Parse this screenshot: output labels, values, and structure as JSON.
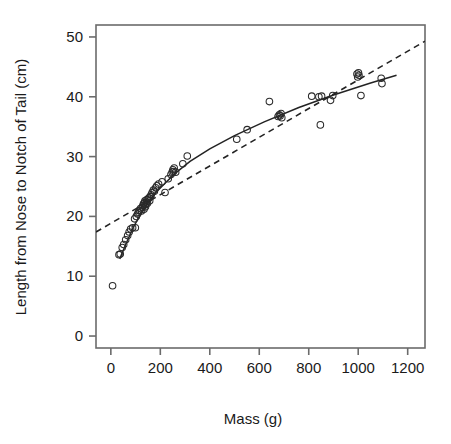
{
  "figure": {
    "width": 451,
    "height": 444,
    "background": "#ffffff",
    "foreground": "#1a1a1a",
    "axis_color": "#6b6b6b",
    "point_color": "#2a2a2a",
    "line_color": "#232323"
  },
  "chart_data": {
    "type": "scatter",
    "title": "",
    "xlabel": "Mass (g)",
    "ylabel": "Length from Nose to Notch of Tail (cm)",
    "xlim": [
      -60,
      1270
    ],
    "ylim": [
      -2,
      52
    ],
    "xticks": [
      0,
      200,
      400,
      600,
      800,
      1000,
      1200
    ],
    "xtick_labels": [
      "0",
      "200",
      "400",
      "600",
      "800",
      "1000",
      "1200"
    ],
    "yticks": [
      0,
      10,
      20,
      30,
      40,
      50
    ],
    "ytick_labels": [
      "0",
      "10",
      "20",
      "30",
      "40",
      "50"
    ],
    "grid": false,
    "legend": null,
    "marker": "open-circle",
    "marker_size": 3.3,
    "points": [
      {
        "x": 7,
        "y": 8.4
      },
      {
        "x": 33,
        "y": 13.6
      },
      {
        "x": 38,
        "y": 13.7
      },
      {
        "x": 46,
        "y": 14.8
      },
      {
        "x": 52,
        "y": 15.3
      },
      {
        "x": 60,
        "y": 16.1
      },
      {
        "x": 68,
        "y": 16.8
      },
      {
        "x": 74,
        "y": 17.4
      },
      {
        "x": 80,
        "y": 17.9
      },
      {
        "x": 88,
        "y": 18.1
      },
      {
        "x": 99,
        "y": 18.1
      },
      {
        "x": 96,
        "y": 19.6
      },
      {
        "x": 103,
        "y": 20.0
      },
      {
        "x": 108,
        "y": 20.4
      },
      {
        "x": 112,
        "y": 20.7
      },
      {
        "x": 116,
        "y": 21.0
      },
      {
        "x": 120,
        "y": 21.3
      },
      {
        "x": 124,
        "y": 20.9
      },
      {
        "x": 127,
        "y": 21.5
      },
      {
        "x": 130,
        "y": 21.8
      },
      {
        "x": 132,
        "y": 22.1
      },
      {
        "x": 134,
        "y": 21.2
      },
      {
        "x": 136,
        "y": 22.3
      },
      {
        "x": 138,
        "y": 22.6
      },
      {
        "x": 140,
        "y": 21.6
      },
      {
        "x": 142,
        "y": 22.0
      },
      {
        "x": 144,
        "y": 22.4
      },
      {
        "x": 146,
        "y": 22.8
      },
      {
        "x": 148,
        "y": 22.2
      },
      {
        "x": 151,
        "y": 22.9
      },
      {
        "x": 154,
        "y": 23.1
      },
      {
        "x": 157,
        "y": 22.6
      },
      {
        "x": 160,
        "y": 23.3
      },
      {
        "x": 163,
        "y": 23.6
      },
      {
        "x": 167,
        "y": 24.0
      },
      {
        "x": 172,
        "y": 24.4
      },
      {
        "x": 176,
        "y": 24.2
      },
      {
        "x": 181,
        "y": 24.8
      },
      {
        "x": 186,
        "y": 25.1
      },
      {
        "x": 193,
        "y": 25.4
      },
      {
        "x": 207,
        "y": 25.8
      },
      {
        "x": 219,
        "y": 24.0
      },
      {
        "x": 232,
        "y": 26.3
      },
      {
        "x": 243,
        "y": 27.0
      },
      {
        "x": 248,
        "y": 27.4
      },
      {
        "x": 251,
        "y": 27.8
      },
      {
        "x": 253,
        "y": 27.5
      },
      {
        "x": 256,
        "y": 28.1
      },
      {
        "x": 262,
        "y": 27.4
      },
      {
        "x": 291,
        "y": 28.8
      },
      {
        "x": 309,
        "y": 30.1
      },
      {
        "x": 509,
        "y": 32.9
      },
      {
        "x": 551,
        "y": 34.5
      },
      {
        "x": 641,
        "y": 39.2
      },
      {
        "x": 676,
        "y": 36.7
      },
      {
        "x": 681,
        "y": 37.0
      },
      {
        "x": 684,
        "y": 36.8
      },
      {
        "x": 688,
        "y": 37.2
      },
      {
        "x": 691,
        "y": 36.5
      },
      {
        "x": 812,
        "y": 40.1
      },
      {
        "x": 841,
        "y": 40.0
      },
      {
        "x": 847,
        "y": 35.3
      },
      {
        "x": 852,
        "y": 40.1
      },
      {
        "x": 888,
        "y": 39.4
      },
      {
        "x": 897,
        "y": 40.2
      },
      {
        "x": 995,
        "y": 43.8
      },
      {
        "x": 998,
        "y": 43.3
      },
      {
        "x": 1001,
        "y": 44.0
      },
      {
        "x": 1003,
        "y": 43.6
      },
      {
        "x": 1011,
        "y": 40.2
      },
      {
        "x": 1093,
        "y": 43.1
      },
      {
        "x": 1096,
        "y": 42.2
      }
    ],
    "fits": [
      {
        "name": "nonlinear-fit",
        "style": "solid",
        "description": "Solid curved fit rising steeply at low mass then flattening",
        "path": [
          {
            "x": 36,
            "y": 12.9
          },
          {
            "x": 60,
            "y": 15.3
          },
          {
            "x": 90,
            "y": 18.1
          },
          {
            "x": 120,
            "y": 20.4
          },
          {
            "x": 150,
            "y": 22.3
          },
          {
            "x": 180,
            "y": 23.9
          },
          {
            "x": 220,
            "y": 25.6
          },
          {
            "x": 260,
            "y": 27.2
          },
          {
            "x": 320,
            "y": 29.2
          },
          {
            "x": 400,
            "y": 31.3
          },
          {
            "x": 500,
            "y": 33.5
          },
          {
            "x": 620,
            "y": 35.8
          },
          {
            "x": 760,
            "y": 38.2
          },
          {
            "x": 900,
            "y": 40.3
          },
          {
            "x": 1050,
            "y": 42.3
          },
          {
            "x": 1155,
            "y": 43.6
          }
        ]
      },
      {
        "name": "linear-fit",
        "style": "dashed",
        "description": "Dashed straight regression line across full x-range",
        "path": [
          {
            "x": -60,
            "y": 17.4
          },
          {
            "x": 1270,
            "y": 49.3
          }
        ]
      }
    ]
  }
}
